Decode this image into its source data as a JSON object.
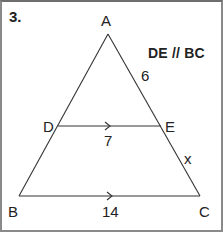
{
  "problem": {
    "number": "3.",
    "given": "DE // BC"
  },
  "figure": {
    "type": "triangle-with-parallel-segment",
    "vertices": {
      "A": {
        "label": "A",
        "x": 108,
        "y": 34
      },
      "B": {
        "label": "B",
        "x": 19,
        "y": 196
      },
      "C": {
        "label": "C",
        "x": 200,
        "y": 196
      },
      "D": {
        "label": "D",
        "x": 58,
        "y": 126
      },
      "E": {
        "label": "E",
        "x": 161,
        "y": 126
      }
    },
    "measures": {
      "AE": "6",
      "DE": "7",
      "EC": "x",
      "BC": "14"
    },
    "line_color": "#333333",
    "border_color": "#8a8a8a"
  }
}
